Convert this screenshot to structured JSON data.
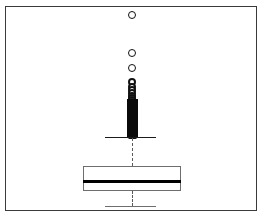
{
  "figure": {
    "type": "boxplot",
    "orientation": "vertical",
    "background_color": "#ffffff",
    "frame_color": "#3a3a3a",
    "marker_color": "#111111",
    "median_color": "#000000",
    "whisker_style": "dashed",
    "title": "",
    "xlabel": "",
    "ylabel": "",
    "axis_labels_visible": false,
    "tick_labels_visible": false,
    "grid": false,
    "legend": false
  },
  "chart_data": {
    "type": "boxplot",
    "title": "",
    "xlabel": "",
    "ylabel": "",
    "grid": false,
    "legend": false,
    "legend_position": "none",
    "categories": [
      "series-1"
    ],
    "orientation": "vertical",
    "axis_range_pixels": {
      "top": 6,
      "bottom": 211
    },
    "box_center_x": 131,
    "series": [
      {
        "name": "series-1",
        "box_left_x": 82,
        "box_right_x": 180,
        "q3_y": 165,
        "median_y": 180,
        "q1_y": 190,
        "lower_whisker_cap_y": 205,
        "upper_whisker_cap_y": 130,
        "whisker_cap_left_x": 104,
        "whisker_cap_right_x": 155,
        "outlier_count_visible": 24,
        "outliers_y": [
          14,
          52,
          67,
          81,
          86,
          89,
          92,
          95,
          97,
          99,
          101,
          103,
          105,
          107,
          109,
          111,
          113,
          115,
          117,
          119,
          121,
          123,
          125,
          128
        ],
        "outlier_radius_px": 4,
        "dense_cluster_top_y": 80,
        "dense_cluster_bottom_y": 130,
        "notes": "Dense overlap of outlier markers forms a near-solid dark column just above the upper whisker cap"
      }
    ]
  }
}
